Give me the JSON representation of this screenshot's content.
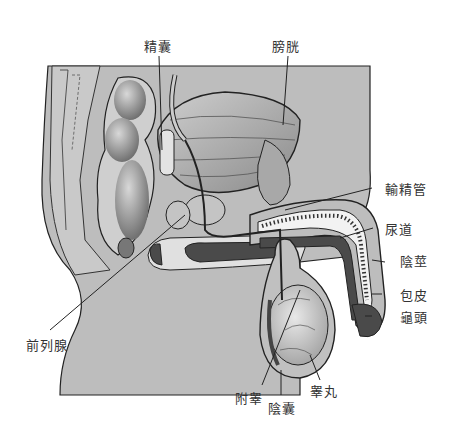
{
  "labels": {
    "seminal_vesicle": "精囊",
    "bladder": "膀胱",
    "vas_deferens": "輸精管",
    "urethra": "尿道",
    "penis": "陰莖",
    "foreskin": "包皮",
    "glans": "龜頭",
    "prostate": "前列腺",
    "epididymis": "附睾",
    "scrotum": "陰囊",
    "testis": "睾丸"
  },
  "colors": {
    "background": "#ffffff",
    "body_fill": "#b9b9b9",
    "organ_fill": "#9a9a9a",
    "dark_tissue": "#4a4a4a",
    "outline": "#222222",
    "label_text": "#333333"
  }
}
